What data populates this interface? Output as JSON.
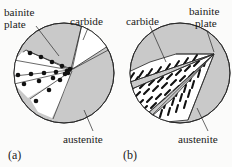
{
  "figure": {
    "background_color": "#fbfbfa",
    "width": 232,
    "height": 167
  },
  "colors": {
    "austenite_fill": "#c9c9c9",
    "bainite_fill": "#ffffff",
    "carbide_fill": "#ffffff",
    "outline": "#2a2a2a",
    "particle": "#111111",
    "text": "#1b1b1b"
  },
  "panels": [
    {
      "id": "a",
      "caption": "(a)",
      "description": "upper bainite: carbide particles line the boundaries between bainite plates",
      "labels": [
        {
          "key": "bainite_plate",
          "text_line1": "bainite",
          "text_line2": "plate",
          "name": "bainite-plate-label"
        },
        {
          "key": "carbide",
          "text_line1": "carbide",
          "text_line2": "",
          "name": "carbide-label"
        },
        {
          "key": "austenite",
          "text_line1": "austenite",
          "text_line2": "",
          "name": "austenite-label"
        }
      ],
      "regions": [
        {
          "name": "austenite-matrix",
          "fill": "#c9c9c9"
        },
        {
          "name": "bainite-sheaf-upper",
          "fill": "#ffffff"
        },
        {
          "name": "bainite-sheaf-middle",
          "fill": "#ffffff"
        },
        {
          "name": "bainite-sheaf-lower",
          "fill": "#ffffff"
        },
        {
          "name": "carbide-wedge",
          "fill": "#ffffff"
        }
      ],
      "carbide_particle_count": 18,
      "carbide_style": "discrete round particles along plate boundaries"
    },
    {
      "id": "b",
      "caption": "(b)",
      "description": "lower bainite: fine carbide platelets precipitate inside the bainite plates",
      "labels": [
        {
          "key": "carbide",
          "text_line1": "carbide",
          "text_line2": "",
          "name": "carbide-label"
        },
        {
          "key": "bainite_plate",
          "text_line1": "bainite",
          "text_line2": "plate",
          "name": "bainite-plate-label"
        },
        {
          "key": "austenite",
          "text_line1": "austenite",
          "text_line2": "",
          "name": "austenite-label"
        }
      ],
      "regions": [
        {
          "name": "austenite-matrix",
          "fill": "#c9c9c9"
        },
        {
          "name": "bainite-plate-upper",
          "fill": "#ffffff"
        },
        {
          "name": "bainite-plate-middle",
          "fill": "#ffffff"
        },
        {
          "name": "bainite-plate-lower",
          "fill": "#ffffff"
        }
      ],
      "carbide_particle_count": 96,
      "carbide_style": "short inclined dashes within the plates"
    }
  ]
}
